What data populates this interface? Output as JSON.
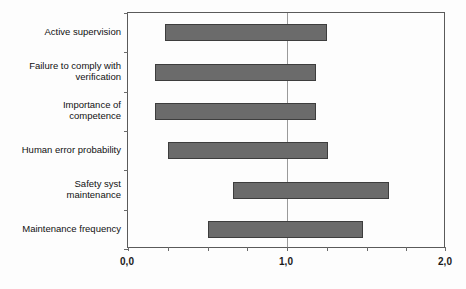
{
  "chart_data": {
    "type": "bar",
    "subtype": "tornado-floating-horizontal-bar",
    "title": "",
    "subtitle": "",
    "xlabel": "",
    "ylabel": "",
    "orientation": "horizontal",
    "grid": false,
    "legend": false,
    "legend_position": "none",
    "baseline": 1.0,
    "xlim": [
      0.0,
      2.0
    ],
    "xticks": [
      0.0,
      1.0,
      2.0
    ],
    "xticklabels": [
      "0,0",
      "1,0",
      "2,0"
    ],
    "xtick_minor_count": 8,
    "decimal_separator": ",",
    "bar_color": "#6b6b6b",
    "bar_border_color": "#3d3d3d",
    "axis_color": "#5a5a5a",
    "gridline_color": "#9a9a9a",
    "categories": [
      "Active supervision",
      "Failure to comply with\nverification",
      "Importance of\ncompetence",
      "Human error probability",
      "Safety syst\nmaintenance",
      "Maintenance frequency"
    ],
    "bars": [
      {
        "category": "Active supervision",
        "low": 0.23,
        "high": 1.25
      },
      {
        "category": "Failure to comply with verification",
        "low": 0.17,
        "high": 1.18
      },
      {
        "category": "Importance of competence",
        "low": 0.17,
        "high": 1.18
      },
      {
        "category": "Human error probability",
        "low": 0.25,
        "high": 1.26
      },
      {
        "category": "Safety syst maintenance",
        "low": 0.66,
        "high": 1.64
      },
      {
        "category": "Maintenance frequency",
        "low": 0.5,
        "high": 1.48
      }
    ],
    "low_values": [
      0.23,
      0.17,
      0.17,
      0.25,
      0.66,
      0.5
    ],
    "high_values": [
      1.25,
      1.18,
      1.18,
      1.26,
      1.64,
      1.48
    ]
  }
}
